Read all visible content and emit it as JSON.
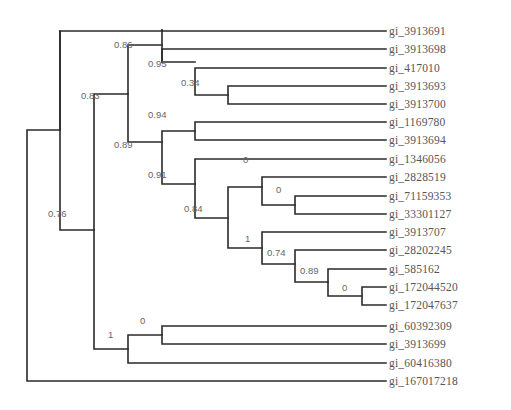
{
  "chart_data": {
    "type": "phylogenetic_tree",
    "title": "",
    "leaves": [
      "gi_3913691",
      "gi_3913698",
      "gi_417010",
      "gi_3913693",
      "gi_3913700",
      "gi_1169780",
      "gi_3913694",
      "gi_1346056",
      "gi_2828519",
      "gi_71159353",
      "gi_33301127",
      "gi_3913707",
      "gi_28202245",
      "gi_585162",
      "gi_172044520",
      "gi_172047637",
      "gi_60392309",
      "gi_3913699",
      "gi_60416380",
      "gi_167017218"
    ],
    "newick": "((gi_3913691,(((gi_3913698,(gi_417010,(gi_3913693,gi_3913700)0.34)0.95)0.86,((gi_1169780,gi_3913694)0.94,(gi_1346056,((gi_2828519,(gi_71159353,gi_33301127)0)0,(gi_3913707,(gi_28202245,(gi_585162,(gi_172044520,gi_172047637)0)0.89)0.74)1)0.84)0.91)0.89)0.83,((gi_60392309,gi_3913699)0,gi_60416380)1)0.76),gi_167017218);",
    "support_values": [
      "0.86",
      "0.95",
      "0.34",
      "0.83",
      "0.94",
      "0.89",
      "0.91",
      "0",
      "0",
      "0.84",
      "1",
      "0.74",
      "0.89",
      "0",
      "0.76",
      "0",
      "1"
    ]
  },
  "tree": {
    "leaves": [
      {
        "label": "gi_3913691",
        "y": 31
      },
      {
        "label": "gi_3913698",
        "y": 49
      },
      {
        "label": "gi_417010",
        "y": 68
      },
      {
        "label": "gi_3913693",
        "y": 86
      },
      {
        "label": "gi_3913700",
        "y": 104
      },
      {
        "label": "gi_1169780",
        "y": 122
      },
      {
        "label": "gi_3913694",
        "y": 140
      },
      {
        "label": "gi_1346056",
        "y": 159
      },
      {
        "label": "gi_2828519",
        "y": 177
      },
      {
        "label": "gi_71159353",
        "y": 196
      },
      {
        "label": "gi_33301127",
        "y": 214
      },
      {
        "label": "gi_3913707",
        "y": 232
      },
      {
        "label": "gi_28202245",
        "y": 250
      },
      {
        "label": "gi_585162",
        "y": 269
      },
      {
        "label": "gi_172044520",
        "y": 287
      },
      {
        "label": "gi_172047637",
        "y": 305
      },
      {
        "label": "gi_60392309",
        "y": 326
      },
      {
        "label": "gi_3913699",
        "y": 344
      },
      {
        "label": "gi_60416380",
        "y": 363
      },
      {
        "label": "gi_167017218",
        "y": 381
      }
    ],
    "supports": [
      {
        "value": "0.86",
        "x": 114,
        "y": 51
      },
      {
        "value": "0.95",
        "x": 148,
        "y": 70
      },
      {
        "value": "0.34",
        "x": 181,
        "y": 89
      },
      {
        "value": "0.83",
        "x": 81,
        "y": 102
      },
      {
        "value": "0.94",
        "x": 148,
        "y": 121
      },
      {
        "value": "0.89",
        "x": 114,
        "y": 151
      },
      {
        "value": "0.91",
        "x": 148,
        "y": 181
      },
      {
        "value": "0",
        "x": 243,
        "y": 166
      },
      {
        "value": "0",
        "x": 276,
        "y": 196
      },
      {
        "value": "0.84",
        "x": 184,
        "y": 215
      },
      {
        "value": "1",
        "x": 245,
        "y": 245
      },
      {
        "value": "0.74",
        "x": 267,
        "y": 259
      },
      {
        "value": "0.89",
        "x": 300,
        "y": 277
      },
      {
        "value": "0",
        "x": 342,
        "y": 294
      },
      {
        "value": "0.76",
        "x": 48,
        "y": 220
      },
      {
        "value": "0",
        "x": 140,
        "y": 327
      },
      {
        "value": "1",
        "x": 108,
        "y": 341
      }
    ]
  }
}
